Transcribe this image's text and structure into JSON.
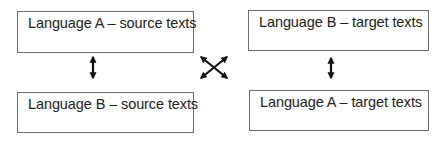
{
  "diagram": {
    "boxes": {
      "top_left": {
        "label": "Language A – source texts"
      },
      "top_right": {
        "label": "Language B – target texts"
      },
      "bottom_left": {
        "label": "Language B – source texts"
      },
      "bottom_right": {
        "label": "Language A – target texts"
      }
    },
    "connectors": [
      {
        "from": "top_left",
        "to": "bottom_left",
        "type": "bidirectional-arrow"
      },
      {
        "from": "top_right",
        "to": "bottom_right",
        "type": "bidirectional-arrow"
      },
      {
        "from": "top_left",
        "to": "bottom_right",
        "type": "bidirectional-arrow"
      },
      {
        "from": "top_right",
        "to": "bottom_left",
        "type": "bidirectional-arrow"
      }
    ],
    "colors": {
      "border": "#6b6b6b",
      "arrow": "#111111",
      "text": "#222222"
    }
  }
}
